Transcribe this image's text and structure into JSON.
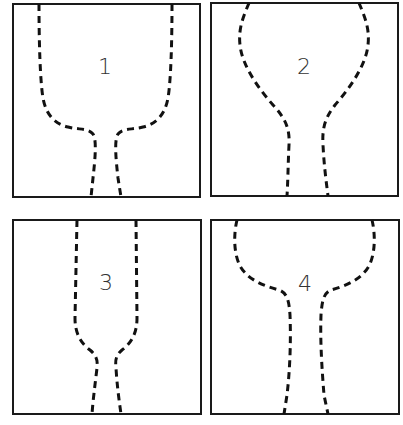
{
  "diagram": {
    "layout": "2x2 grid of framed panels",
    "panels": [
      {
        "id": 1,
        "label": "1",
        "frame": {
          "x": 13,
          "y": 4,
          "w": 187,
          "h": 193
        },
        "label_pos": {
          "x": 105,
          "y": 68
        },
        "left_path": "M39,4 C39,40 40,80 43,98 C46,115 55,124 68,127 C80,130 88,128 93,134 C97,140 95,160 93,178 L91,197",
        "right_path": "M172,4 C172,40 171,80 168,98 C165,115 156,124 143,127 C131,130 123,128 118,134 C114,140 116,160 118,178 L121,197",
        "description": "wide cylindrical upper bowl with flat shoulder narrowing to a thin stem"
      },
      {
        "id": 2,
        "label": "2",
        "frame": {
          "x": 211,
          "y": 3,
          "w": 187,
          "h": 193
        },
        "label_pos": {
          "x": 304,
          "y": 68
        },
        "left_path": "M249,3 C244,15 238,28 240,45 C242,65 258,88 273,105 C285,118 290,128 289,145 C288,165 288,180 287,196",
        "right_path": "M359,3 C364,15 370,28 368,45 C366,65 350,88 335,105 C325,118 322,128 323,145 C324,165 326,180 328,196",
        "description": "rounded bulb top tapering gradually to a stem"
      },
      {
        "id": 3,
        "label": "3",
        "frame": {
          "x": 13,
          "y": 220,
          "w": 188,
          "h": 194
        },
        "label_pos": {
          "x": 106,
          "y": 284
        },
        "left_path": "M77,220 L75,318 C75,335 82,344 90,350 C96,355 98,360 97,368 C95,385 93,400 92,414",
        "right_path": "M136,220 L137,318 C137,335 130,344 122,350 C116,355 115,360 116,368 C117,385 119,400 121,414",
        "description": "narrow straight-walled upper tube with short shoulder to a slightly flared stem"
      },
      {
        "id": 4,
        "label": "4",
        "frame": {
          "x": 211,
          "y": 220,
          "w": 188,
          "h": 194
        },
        "label_pos": {
          "x": 305,
          "y": 285
        },
        "left_path": "M237,220 C234,232 233,252 240,266 C248,280 264,286 279,290 C287,293 289,300 290,315 C291,340 290,370 287,395 L284,414",
        "right_path": "M372,220 C375,232 376,252 369,266 C361,280 345,286 331,290 C324,293 322,300 321,315 C320,340 322,370 324,395 L328,414",
        "description": "wide rounded bowl top with a sharp shoulder into a long tapering stem"
      }
    ],
    "style": {
      "frame_color": "#1a1a1a",
      "dash_color": "#111111",
      "label_color": "#333333",
      "background": "#ffffff"
    }
  }
}
